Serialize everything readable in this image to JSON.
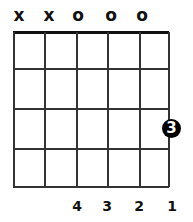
{
  "chord": {
    "string_markers": [
      "x",
      "x",
      "o",
      "o",
      "o",
      ""
    ],
    "dots": [
      {
        "label": "3",
        "fret": 3,
        "position": "right-edge"
      }
    ],
    "finger_labels": [
      "4",
      "3",
      "2",
      "1"
    ],
    "frets_shown": 4,
    "strings": 6
  }
}
